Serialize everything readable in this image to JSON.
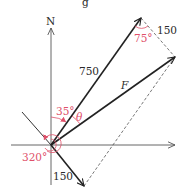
{
  "diagram": {
    "title_fragment": "g",
    "axis": {
      "north_label": "N"
    },
    "vectors": [
      {
        "name": "force-750",
        "label": "750",
        "color": "#222222"
      },
      {
        "name": "resultant-F",
        "label": "F",
        "color": "#222222"
      },
      {
        "name": "force-150",
        "label": "150",
        "color": "#222222"
      }
    ],
    "parallelogram": {
      "side_label": "150"
    },
    "angles": {
      "bearing_750": "35°",
      "theta": "θ",
      "bearing_150": "320°",
      "parallelogram_angle": "75°"
    },
    "colors": {
      "ink": "#222222",
      "axis": "#444444",
      "angle_red": "#e0506a",
      "dashed": "#555555"
    }
  }
}
